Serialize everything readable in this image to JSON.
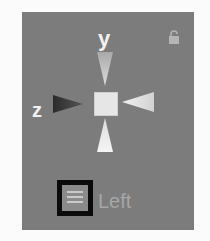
{
  "gizmo": {
    "axis_labels": {
      "y": "y",
      "z": "z"
    },
    "view_label": "Left",
    "icons": {
      "lock": "lock-icon",
      "cube": "center-cube-icon",
      "cone_y": "y-axis-cone-icon",
      "cone_z": "z-axis-cone-icon",
      "cone_x": "x-axis-cone-icon",
      "cone_neg_y": "neg-y-axis-cone-icon",
      "view_menu": "view-menu-icon"
    }
  },
  "colors": {
    "panel_bg": "#7c7c7c",
    "label": "#f2f2f2",
    "highlight_border": "#0b0b0b"
  }
}
